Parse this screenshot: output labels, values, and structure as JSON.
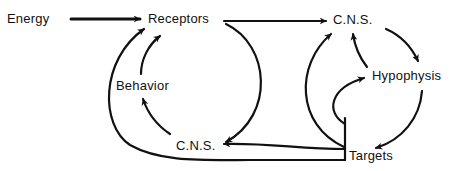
{
  "diagram": {
    "type": "flow",
    "nodes": [
      {
        "id": "energy",
        "label": "Energy"
      },
      {
        "id": "receptors",
        "label": "Receptors"
      },
      {
        "id": "cns_top",
        "label": "C.N.S."
      },
      {
        "id": "hypophysis",
        "label": "Hypophysis"
      },
      {
        "id": "behavior",
        "label": "Behavior"
      },
      {
        "id": "cns_bottom",
        "label": "C.N.S."
      },
      {
        "id": "targets",
        "label": "Targets"
      }
    ],
    "edges": [
      {
        "from": "energy",
        "to": "receptors"
      },
      {
        "from": "receptors",
        "to": "cns_top"
      },
      {
        "from": "receptors",
        "to": "cns_bottom"
      },
      {
        "from": "cns_top",
        "to": "hypophysis"
      },
      {
        "from": "hypophysis",
        "to": "cns_top"
      },
      {
        "from": "hypophysis",
        "to": "targets"
      },
      {
        "from": "targets",
        "to": "hypophysis"
      },
      {
        "from": "targets",
        "to": "cns_top"
      },
      {
        "from": "targets",
        "to": "cns_bottom"
      },
      {
        "from": "targets",
        "to": "receptors"
      },
      {
        "from": "cns_bottom",
        "to": "behavior"
      },
      {
        "from": "behavior",
        "to": "receptors"
      }
    ],
    "stroke_color": "#111111"
  }
}
